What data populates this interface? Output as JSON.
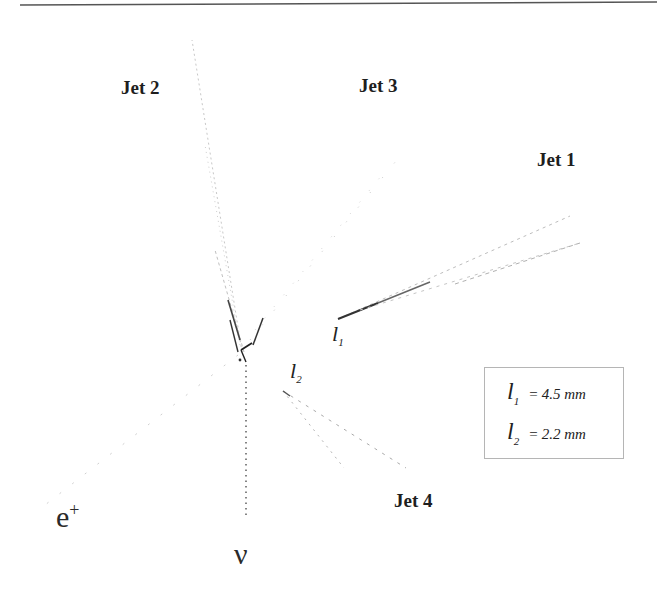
{
  "diagram": {
    "type": "particle-event-display",
    "jets": [
      {
        "id": "jet1",
        "label": "Jet 1"
      },
      {
        "id": "jet2",
        "label": "Jet 2"
      },
      {
        "id": "jet3",
        "label": "Jet 3"
      },
      {
        "id": "jet4",
        "label": "Jet 4"
      }
    ],
    "particles": {
      "positron": {
        "base": "e",
        "sup": "+"
      },
      "neutrino": {
        "label": "ν"
      }
    },
    "decay_lengths": [
      {
        "symbol": "l",
        "sub": "1",
        "equals": "=",
        "value": "4.5 mm"
      },
      {
        "symbol": "l",
        "sub": "2",
        "equals": "=",
        "value": "2.2 mm"
      }
    ],
    "colors": {
      "track_dark": "#2b2b2b",
      "track_light": "#bdbdbd",
      "text": "#1e1e1e",
      "legend_border": "#b5b5b5"
    }
  }
}
